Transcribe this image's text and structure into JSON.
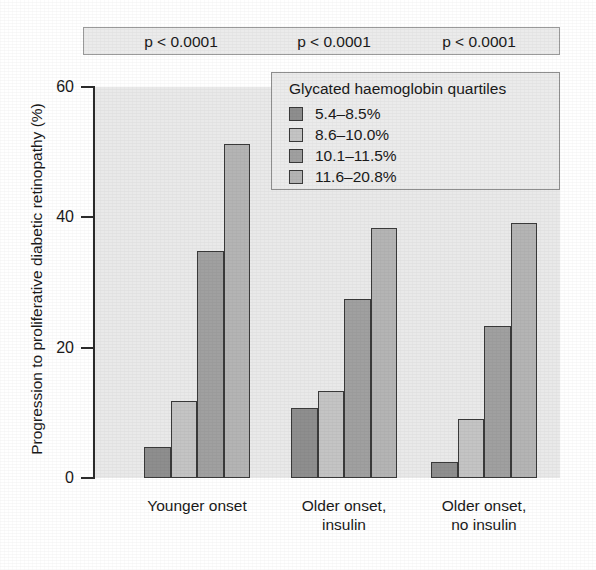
{
  "chart_data": {
    "type": "bar",
    "title": "",
    "xlabel": "",
    "ylabel": "Progression to proliferative diabetic retinopathy (%)",
    "ylim": [
      0,
      60
    ],
    "yticks": [
      0,
      20,
      40,
      60
    ],
    "ytick_labels": [
      "0",
      "20",
      "40",
      "60"
    ],
    "grid": false,
    "legend_position": "top-right",
    "legend_title": "Glycated haemoglobin quartiles",
    "categories": [
      "Younger onset",
      "Older onset, insulin",
      "Older onset, no insulin"
    ],
    "series": [
      {
        "name": "5.4–8.5%",
        "values": [
          4.7,
          10.8,
          2.5
        ]
      },
      {
        "name": "8.6–10.0%",
        "values": [
          11.8,
          13.4,
          9.0
        ]
      },
      {
        "name": "10.1–11.5%",
        "values": [
          34.8,
          27.5,
          23.3
        ]
      },
      {
        "name": "11.6–20.8%",
        "values": [
          51.2,
          38.3,
          39.2
        ]
      }
    ],
    "annotations": [
      "p < 0.0001",
      "p < 0.0001",
      "p < 0.0001"
    ]
  },
  "banner": {
    "pvalues": [
      "p < 0.0001",
      "p < 0.0001",
      "p < 0.0001"
    ]
  },
  "axes": {
    "y_title": "Progression to proliferative diabetic retinopathy (%)",
    "y_tick_labels": [
      "60",
      "40",
      "20",
      "0"
    ],
    "x_group_labels": [
      "Younger onset",
      "Older onset,\ninsulin",
      "Older onset,\nno insulin"
    ]
  },
  "legend": {
    "title": "Glycated haemoglobin quartiles",
    "items": [
      {
        "label": "5.4–8.5%",
        "color": "#8e8e8e"
      },
      {
        "label": "8.6–10.0%",
        "color": "#c4c4c4"
      },
      {
        "label": "10.1–11.5%",
        "color": "#a0a0a0"
      },
      {
        "label": "11.6–20.8%",
        "color": "#b4b4b4"
      }
    ]
  },
  "colors": {
    "q1": "#8e8e8e",
    "q2": "#c4c4c4",
    "q3": "#a0a0a0",
    "q4": "#b4b4b4",
    "plot_background": "#e9e9e9",
    "panel_background": "#ebebeb",
    "axis": "#2b2b2b",
    "bar_outline": "#3a3a3a",
    "text": "#1a1a1a"
  }
}
